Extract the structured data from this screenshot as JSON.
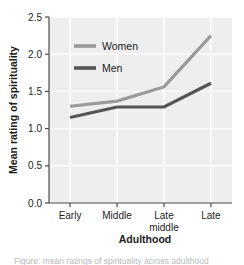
{
  "chart_data": {
    "type": "line",
    "title": "",
    "xlabel": "Adulthood",
    "ylabel": "Mean rating of spirituality",
    "categories": [
      "Early",
      "Middle",
      "Late middle",
      "Late"
    ],
    "category_lines": [
      [
        "Early"
      ],
      [
        "Middle"
      ],
      [
        "Late",
        "middle"
      ],
      [
        "Late"
      ]
    ],
    "series": [
      {
        "name": "Women",
        "values": [
          1.3,
          1.37,
          1.56,
          2.25
        ],
        "color": "#9a9a9a"
      },
      {
        "name": "Men",
        "values": [
          1.15,
          1.29,
          1.29,
          1.61
        ],
        "color": "#555555"
      }
    ],
    "ylim": [
      0.0,
      2.5
    ],
    "yticks": [
      0.0,
      0.5,
      1.0,
      1.5,
      2.0,
      2.5
    ],
    "ytick_labels": [
      "0.0",
      "0.5",
      "1.0",
      "1.5",
      "2.0",
      "2.5"
    ],
    "grid": true,
    "grid_color": "#ffffff",
    "plot_background": "#eeeeee",
    "legend_position": "upper-left-inside"
  },
  "legend": {
    "entries": [
      {
        "label": "Women",
        "swatch_color": "#9a9a9a"
      },
      {
        "label": "Men",
        "swatch_color": "#555555"
      }
    ]
  },
  "caption": {
    "text": "Figure: mean ratings of spirituality across adulthood"
  }
}
